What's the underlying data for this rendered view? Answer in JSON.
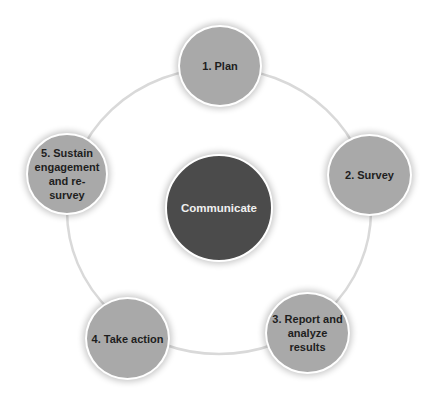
{
  "diagram": {
    "type": "cycle",
    "center": {
      "label": "Communicate",
      "color": "#4b4b4b"
    },
    "steps": [
      {
        "label": "1. Plan"
      },
      {
        "label": "2. Survey"
      },
      {
        "label": "3. Report and\nanalyze results"
      },
      {
        "label": "4. Take action"
      },
      {
        "label": "5. Sustain\nengagement\nand re-survey"
      }
    ],
    "colors": {
      "step_fill": "#a9a9a9",
      "ring_stroke": "#d9d9d9",
      "border": "#ffffff"
    }
  }
}
